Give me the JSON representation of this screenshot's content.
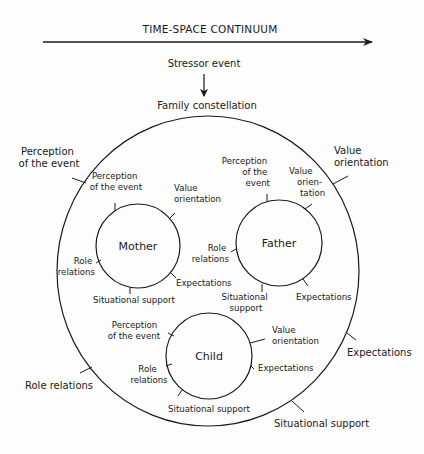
{
  "header": {
    "axis_title": "TIME-SPACE CONTINUUM",
    "stressor": "Stressor event",
    "family": "Family constellation"
  },
  "outer_circle": {
    "labels": {
      "perception": [
        "Perception",
        "of the event"
      ],
      "value": [
        "Value",
        "orientation"
      ],
      "expectations": "Expectations",
      "situational": "Situational support",
      "role": "Role relations"
    }
  },
  "members": [
    {
      "name": "Mother",
      "perception": [
        "Perception",
        "of the event"
      ],
      "value": [
        "Value",
        "orientation"
      ],
      "role": [
        "Role",
        "relations"
      ],
      "expectations": "Expectations",
      "situational": [
        "Situational support"
      ]
    },
    {
      "name": "Father",
      "perception": [
        "Perception",
        "of the",
        "event"
      ],
      "value": [
        "Value",
        "orien-",
        "tation"
      ],
      "role": [
        "Role",
        "relations"
      ],
      "expectations": "Expectations",
      "situational": [
        "Situational",
        "support"
      ]
    },
    {
      "name": "Child",
      "perception": [
        "Perception",
        "of the event"
      ],
      "value": [
        "Value",
        "orientation"
      ],
      "role": [
        "Role",
        "relations"
      ],
      "expectations": "Expectations",
      "situational": [
        "Situational support"
      ]
    }
  ],
  "colors": {
    "ink": "#1a1a1a",
    "background": "#fdfdfd"
  }
}
